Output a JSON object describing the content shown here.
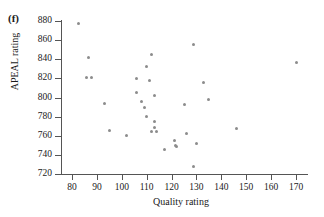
{
  "panel": {
    "label": "(f)"
  },
  "chart_data": {
    "type": "scatter",
    "title": "",
    "xlabel": "Quality rating",
    "ylabel": "APEAL rating",
    "xlim": [
      76,
      176
    ],
    "ylim": [
      716,
      886
    ],
    "xticks": [
      80,
      90,
      100,
      110,
      120,
      130,
      140,
      150,
      160,
      170
    ],
    "yticks": [
      720,
      740,
      760,
      780,
      800,
      820,
      840,
      860,
      880
    ],
    "grid": false,
    "legend": null,
    "marker_color": "#8c8c8c",
    "axis_color": "#555555",
    "points": [
      {
        "x": 82.5,
        "y": 877
      },
      {
        "x": 86.5,
        "y": 842
      },
      {
        "x": 86.0,
        "y": 821
      },
      {
        "x": 88.0,
        "y": 821
      },
      {
        "x": 93.0,
        "y": 794
      },
      {
        "x": 95.0,
        "y": 766
      },
      {
        "x": 102.0,
        "y": 760
      },
      {
        "x": 106.0,
        "y": 820
      },
      {
        "x": 106.0,
        "y": 805
      },
      {
        "x": 108.0,
        "y": 796
      },
      {
        "x": 109.0,
        "y": 790
      },
      {
        "x": 110.0,
        "y": 832
      },
      {
        "x": 110.0,
        "y": 780
      },
      {
        "x": 111.0,
        "y": 818
      },
      {
        "x": 112.0,
        "y": 845
      },
      {
        "x": 112.0,
        "y": 764
      },
      {
        "x": 113.0,
        "y": 802
      },
      {
        "x": 113.0,
        "y": 775
      },
      {
        "x": 113.0,
        "y": 769
      },
      {
        "x": 114.0,
        "y": 764
      },
      {
        "x": 117.0,
        "y": 746
      },
      {
        "x": 121.0,
        "y": 755
      },
      {
        "x": 121.5,
        "y": 750
      },
      {
        "x": 122.0,
        "y": 749
      },
      {
        "x": 125.0,
        "y": 793
      },
      {
        "x": 126.0,
        "y": 762
      },
      {
        "x": 129.0,
        "y": 855
      },
      {
        "x": 129.0,
        "y": 728
      },
      {
        "x": 130.0,
        "y": 752
      },
      {
        "x": 133.0,
        "y": 816
      },
      {
        "x": 135.0,
        "y": 798
      },
      {
        "x": 146.0,
        "y": 768
      },
      {
        "x": 170.0,
        "y": 837
      }
    ]
  }
}
